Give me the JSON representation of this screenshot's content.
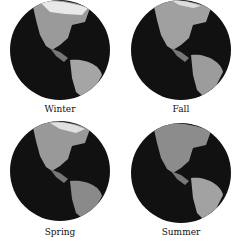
{
  "figure": {
    "panels": [
      {
        "label": "Winter"
      },
      {
        "label": "Fall"
      },
      {
        "label": "Spring"
      },
      {
        "label": "Summer"
      }
    ]
  }
}
